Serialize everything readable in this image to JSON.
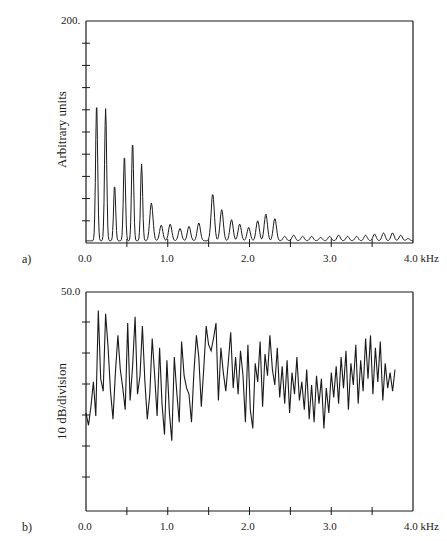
{
  "chart_data": [
    {
      "panel": "a)",
      "type": "line",
      "title": "",
      "xlabel": "kHz",
      "ylabel": "Arbitrary units",
      "xlim": [
        0.0,
        4.0
      ],
      "ylim": [
        0,
        200
      ],
      "x_tick_labels": [
        "0.0",
        "1.0",
        "2.0",
        "3.0",
        "4.0 kHz"
      ],
      "y_tick_labels": [
        "200."
      ],
      "y_minor_tick_step": 20,
      "grid": false,
      "peaks": {
        "x": [
          0.13,
          0.24,
          0.35,
          0.47,
          0.57,
          0.68,
          0.8,
          0.92,
          1.03,
          1.15,
          1.26,
          1.38,
          1.55,
          1.66,
          1.78,
          1.88,
          1.99,
          2.1,
          2.2,
          2.31,
          2.43,
          2.54,
          2.65,
          2.76,
          2.87,
          2.98,
          3.09,
          3.2,
          3.31,
          3.42,
          3.53,
          3.64,
          3.75,
          3.85,
          3.94
        ],
        "y": [
          124,
          119,
          50,
          77,
          89,
          69,
          34,
          14,
          15,
          11,
          13,
          16,
          42,
          28,
          19,
          15,
          12,
          18,
          24,
          20,
          4,
          5,
          4,
          4,
          3,
          4,
          5,
          4,
          4,
          5,
          6,
          7,
          7,
          5,
          2
        ]
      }
    },
    {
      "panel": "b)",
      "type": "line",
      "title": "",
      "xlabel": "kHz",
      "ylabel": "10 dB/division",
      "xlim": [
        0.0,
        4.0
      ],
      "ylim_top_label": "50.0",
      "x_tick_labels": [
        "0.0",
        "1.0",
        "2.0",
        "3.0",
        "4.0 kHz"
      ],
      "y_tick_labels": [
        "50.0"
      ],
      "grid": false,
      "x": [
        0.0,
        0.03,
        0.06,
        0.09,
        0.12,
        0.15,
        0.18,
        0.21,
        0.24,
        0.27,
        0.3,
        0.33,
        0.36,
        0.39,
        0.42,
        0.45,
        0.48,
        0.51,
        0.54,
        0.57,
        0.6,
        0.63,
        0.66,
        0.69,
        0.72,
        0.75,
        0.78,
        0.81,
        0.84,
        0.87,
        0.9,
        0.93,
        0.96,
        0.99,
        1.02,
        1.05,
        1.08,
        1.11,
        1.14,
        1.17,
        1.2,
        1.23,
        1.26,
        1.29,
        1.32,
        1.35,
        1.38,
        1.41,
        1.44,
        1.47,
        1.5,
        1.53,
        1.56,
        1.59,
        1.62,
        1.65,
        1.68,
        1.71,
        1.74,
        1.77,
        1.8,
        1.83,
        1.86,
        1.89,
        1.92,
        1.95,
        1.98,
        2.01,
        2.04,
        2.07,
        2.1,
        2.13,
        2.16,
        2.19,
        2.22,
        2.25,
        2.28,
        2.31,
        2.34,
        2.37,
        2.4,
        2.43,
        2.46,
        2.49,
        2.52,
        2.55,
        2.58,
        2.61,
        2.64,
        2.67,
        2.7,
        2.73,
        2.76,
        2.79,
        2.82,
        2.85,
        2.88,
        2.91,
        2.94,
        2.97,
        3.0,
        3.03,
        3.06,
        3.09,
        3.12,
        3.15,
        3.18,
        3.21,
        3.24,
        3.27,
        3.3,
        3.33,
        3.36,
        3.39,
        3.42,
        3.45,
        3.48,
        3.51,
        3.54,
        3.57,
        3.6,
        3.63,
        3.66,
        3.69,
        3.72,
        3.75,
        3.78,
        3.81,
        3.84,
        3.87,
        3.9,
        3.93,
        3.96,
        3.99
      ],
      "y_db": [
        11,
        7,
        13,
        21,
        10,
        44,
        22,
        18,
        43,
        32,
        18,
        9,
        24,
        36,
        25,
        19,
        12,
        40,
        15,
        26,
        42,
        17,
        23,
        39,
        21,
        9,
        17,
        35,
        23,
        10,
        32,
        14,
        4,
        28,
        11,
        2,
        29,
        18,
        8,
        34,
        23,
        19,
        17,
        8,
        24,
        36,
        29,
        13,
        25,
        39,
        33,
        31,
        35,
        40,
        15,
        32,
        24,
        18,
        27,
        37,
        19,
        29,
        17,
        31,
        23,
        8,
        33,
        12,
        6,
        27,
        21,
        34,
        13,
        30,
        23,
        36,
        25,
        20,
        32,
        16,
        26,
        14,
        28,
        11,
        24,
        17,
        29,
        15,
        21,
        12,
        25,
        9,
        20,
        8,
        23,
        14,
        22,
        6,
        19,
        11,
        24,
        16,
        26,
        14,
        29,
        19,
        31,
        12,
        27,
        20,
        33,
        14,
        28,
        18,
        35,
        22,
        36,
        17,
        32,
        21,
        34,
        15,
        27,
        19,
        24,
        18,
        25
      ]
    }
  ],
  "labels": {
    "panel_a": "a)",
    "panel_b": "b)",
    "a_ylabel": "Arbitrary units",
    "b_ylabel": "10 dB/division",
    "a_ytop": "200.",
    "b_ytop": "50.0",
    "x0": "0.0",
    "x1": "1.0",
    "x2": "2.0",
    "x3": "3.0",
    "x4": "4.0 kHz"
  }
}
